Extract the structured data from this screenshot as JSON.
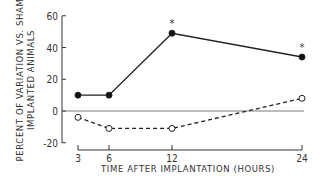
{
  "chart_data": {
    "type": "line",
    "title": "",
    "xlabel": "TIME AFTER IMPLANTATION (HOURS)",
    "ylabel_line1": "PERCENT OF VARIATION VS. SHAM",
    "ylabel_line2": "IMPLANTED ANIMALS",
    "x": [
      3,
      6,
      12,
      24
    ],
    "x_tick_labels": [
      "3",
      "6",
      "12",
      "24"
    ],
    "y_ticks": [
      60,
      40,
      20,
      0,
      -20
    ],
    "y_tick_labels": [
      "60",
      "40",
      "20",
      "0",
      "-20"
    ],
    "ylim": [
      -20,
      60
    ],
    "grid": false,
    "zero_line": true,
    "series": [
      {
        "name": "filled",
        "marker": "filled-circle",
        "line": "solid",
        "values": [
          10,
          10,
          49,
          34
        ],
        "significant": [
          false,
          false,
          true,
          true
        ]
      },
      {
        "name": "open",
        "marker": "open-circle",
        "line": "dashed",
        "values": [
          -4,
          -11,
          -11,
          8
        ],
        "significant": [
          false,
          false,
          false,
          false
        ]
      }
    ],
    "annotations": [
      "*",
      "*"
    ]
  }
}
